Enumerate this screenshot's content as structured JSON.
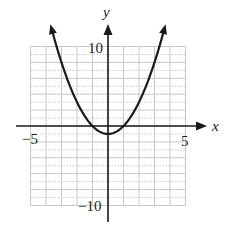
{
  "chart_data": {
    "type": "line",
    "title": "",
    "function": "y = x^2 - 1",
    "xlabel": "x",
    "ylabel": "y",
    "xlim": [
      -5,
      5
    ],
    "ylim": [
      -10,
      10
    ],
    "x_ticks_labeled": [
      -5,
      5
    ],
    "y_ticks_labeled": [
      10,
      -10
    ],
    "grid": true,
    "series": [
      {
        "name": "parabola",
        "x": [
          -3.6,
          -3,
          -2,
          -1,
          0,
          1,
          2,
          3,
          3.6
        ],
        "y": [
          11.96,
          8,
          3,
          0,
          -1,
          0,
          3,
          8,
          11.96
        ]
      }
    ],
    "vertex": [
      0,
      -1
    ],
    "x_intercepts": [
      -1,
      1
    ],
    "colors": {
      "curve": "#1a1a1a",
      "axis": "#1a1a1a",
      "grid": "#c8c8c8"
    }
  },
  "labels": {
    "x_axis": "x",
    "y_axis": "y",
    "x_min": "−5",
    "x_max": "5",
    "y_max": "10",
    "y_min": "−10"
  }
}
